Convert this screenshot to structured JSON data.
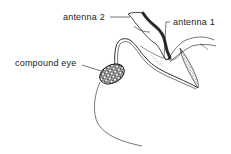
{
  "diagram": {
    "labels": [
      {
        "id": "antenna2",
        "text": "antenna 2"
      },
      {
        "id": "antenna1",
        "text": "antenna 1"
      },
      {
        "id": "compound_eye",
        "text": "compound eye"
      }
    ],
    "colors": {
      "ink": "#1a1a1a",
      "background": "#ffffff",
      "shading": "#555555"
    }
  }
}
